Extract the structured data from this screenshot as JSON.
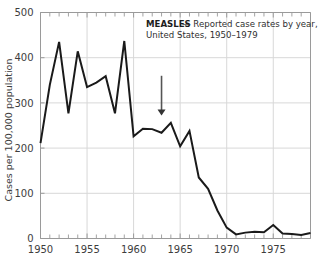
{
  "figure": {
    "title_bold": "MEASLES",
    "title_rest": "— Reported case rates by year,",
    "title_line2": "United States, 1950–1979",
    "annotation_arrow_label": "vaccine-introduction-arrow",
    "annotation_arrow_year": 1963,
    "background_color": "#ffffff",
    "line_color": "#1a1a1a",
    "grid_color": "#d8d8d8",
    "axis_color": "#9a9a9a",
    "text_color": "#3d3d3d"
  },
  "chart_data": {
    "type": "line",
    "title": "MEASLES — Reported case rates by year, United States, 1950–1979",
    "xlabel": "",
    "ylabel": "Cases per 100,000 population",
    "xlim": [
      1950,
      1979
    ],
    "ylim": [
      0,
      500
    ],
    "ytick_labels": [
      "0",
      "100",
      "200",
      "300",
      "400",
      "500"
    ],
    "ytick_values": [
      0,
      100,
      200,
      300,
      400,
      500
    ],
    "xtick_labels": [
      "1950",
      "1955",
      "1960",
      "1965",
      "1970",
      "1975"
    ],
    "xtick_values": [
      1950,
      1955,
      1960,
      1965,
      1970,
      1975
    ],
    "minor_xtick_interval": 1,
    "grid": "horizontal-and-vertical-major",
    "legend": "none",
    "x": [
      1950,
      1951,
      1952,
      1953,
      1954,
      1955,
      1956,
      1957,
      1958,
      1959,
      1960,
      1961,
      1962,
      1963,
      1964,
      1965,
      1966,
      1967,
      1968,
      1969,
      1970,
      1971,
      1972,
      1973,
      1974,
      1975,
      1976,
      1977,
      1978,
      1979
    ],
    "values": [
      211,
      340,
      435,
      277,
      414,
      335,
      345,
      359,
      277,
      437,
      226,
      243,
      242,
      234,
      256,
      204,
      238,
      135,
      110,
      62,
      24,
      9,
      13,
      15,
      14,
      30,
      11,
      10,
      8,
      12
    ],
    "series": [
      {
        "name": "Reported measles case rate per 100,000 population",
        "values": [
          211,
          340,
          435,
          277,
          414,
          335,
          345,
          359,
          277,
          437,
          226,
          243,
          242,
          234,
          256,
          204,
          238,
          135,
          110,
          62,
          24,
          9,
          13,
          15,
          14,
          30,
          11,
          10,
          8,
          12
        ]
      }
    ],
    "annotations": [
      {
        "type": "arrow",
        "x": 1963,
        "points_to_y": 250,
        "direction": "down",
        "meaning": "measles vaccine licensed"
      }
    ]
  }
}
